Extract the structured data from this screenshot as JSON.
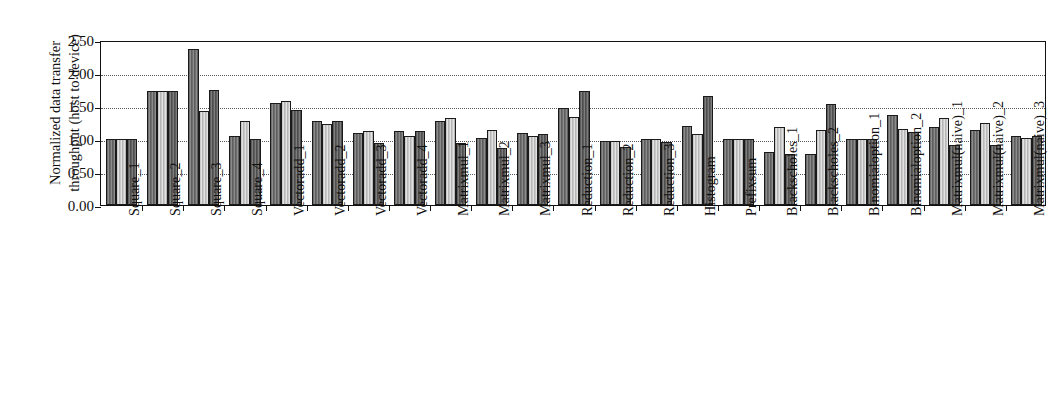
{
  "chart_data": {
    "type": "bar",
    "title": "",
    "xlabel": "",
    "ylabel": "Normalized data transfer throughput (host to device)",
    "ylabel_line1": "Normalized data transfer",
    "ylabel_line2": "throughput (host to device)",
    "ylim": [
      0.0,
      2.5
    ],
    "yticks": [
      0.0,
      0.5,
      1.0,
      1.5,
      2.0,
      2.5
    ],
    "ytick_labels": [
      "0.00",
      "0.50",
      "1.00",
      "1.50",
      "2.00",
      "2.50"
    ],
    "grid": true,
    "grid_style": "dotted",
    "grid_axis": "y",
    "legend": "none",
    "legend_position": "none",
    "bar_colors": [
      "#6e6e6e",
      "#c9c9c9",
      "#5e5e5e"
    ],
    "categories": [
      "Square_1",
      "Square_2",
      "Square_3",
      "Square_4",
      "Vectoradd_1",
      "Vectoradd_2",
      "Vectoradd_3",
      "Vectoradd_4",
      "Matrixmul_1",
      "Matrixmul_2",
      "Matrixmul_3",
      "Reduction_1",
      "Reduction_2",
      "Reduction_3",
      "Histogram",
      "Prefixsum",
      "Blackscholes_1",
      "Blackscholes_2",
      "Binomialoption_1",
      "Binomialoption_2",
      "Matrixmul(naive)_1",
      "Matrixmul(naive)_2",
      "Matrixmul(naive)_3"
    ],
    "series": [
      {
        "name": "series-1",
        "values": [
          1.0,
          1.72,
          2.37,
          1.04,
          1.54,
          1.27,
          1.09,
          1.12,
          1.27,
          1.01,
          1.09,
          1.47,
          0.97,
          1.0,
          1.19,
          1.0,
          0.81,
          0.78,
          1.0,
          1.37,
          1.18,
          1.14,
          1.05
        ]
      },
      {
        "name": "series-2",
        "values": [
          1.0,
          1.72,
          1.43,
          1.27,
          1.57,
          1.22,
          1.12,
          1.05,
          1.32,
          1.13,
          1.05,
          1.34,
          0.97,
          1.0,
          1.07,
          1.0,
          1.18,
          1.14,
          1.0,
          1.15,
          1.32,
          1.25,
          1.02
        ]
      },
      {
        "name": "series-3",
        "values": [
          1.0,
          1.72,
          1.74,
          1.0,
          1.44,
          1.28,
          0.94,
          1.12,
          0.94,
          0.86,
          1.08,
          1.72,
          0.88,
          0.95,
          1.65,
          1.0,
          0.77,
          1.53,
          1.0,
          1.11,
          0.91,
          0.91,
          1.05
        ]
      }
    ]
  }
}
